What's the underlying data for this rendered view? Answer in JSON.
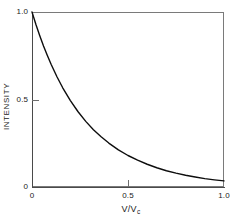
{
  "figure": {
    "background_color": "#ffffff",
    "frame_color": "#7a7a7a",
    "curve_color": "#0d0d0d"
  },
  "axes": {
    "y_title": "INTENSITY",
    "x_title_main": "V/V",
    "x_title_sub": "c",
    "y_ticks": [
      {
        "value": 0,
        "label": "0"
      },
      {
        "value": 0.5,
        "label": "0.5"
      },
      {
        "value": 1.0,
        "label": "1.0"
      }
    ],
    "x_ticks": [
      {
        "value": 0,
        "label": "0"
      },
      {
        "value": 0.5,
        "label": "0.5"
      },
      {
        "value": 1.0,
        "label": "1.0"
      }
    ]
  },
  "chart_data": {
    "type": "line",
    "title": "",
    "subtitle": "",
    "xlabel": "V/Vc",
    "ylabel": "INTENSITY",
    "xlim": [
      0,
      1.0
    ],
    "ylim": [
      0,
      1.0
    ],
    "xticks": [
      0,
      0.5,
      1.0
    ],
    "xticklabels": [
      "0",
      "0.5",
      "1.0"
    ],
    "yticks": [
      0,
      0.5,
      1.0
    ],
    "yticklabels": [
      "0",
      "0.5",
      "1.0"
    ],
    "grid": false,
    "legend": null,
    "annotations": [],
    "series": [
      {
        "name": "intensity",
        "color": "#0d0d0d",
        "linewidth": 1.4,
        "x": [
          0.0,
          0.02,
          0.04,
          0.06,
          0.08,
          0.1,
          0.13,
          0.16,
          0.2,
          0.24,
          0.28,
          0.32,
          0.36,
          0.4,
          0.45,
          0.5,
          0.55,
          0.6,
          0.65,
          0.7,
          0.75,
          0.8,
          0.85,
          0.9,
          0.95,
          1.0
        ],
        "y": [
          1.0,
          0.93,
          0.866,
          0.806,
          0.752,
          0.7,
          0.63,
          0.567,
          0.494,
          0.43,
          0.375,
          0.327,
          0.287,
          0.251,
          0.212,
          0.18,
          0.153,
          0.13,
          0.11,
          0.093,
          0.079,
          0.067,
          0.057,
          0.048,
          0.041,
          0.035
        ]
      }
    ]
  }
}
